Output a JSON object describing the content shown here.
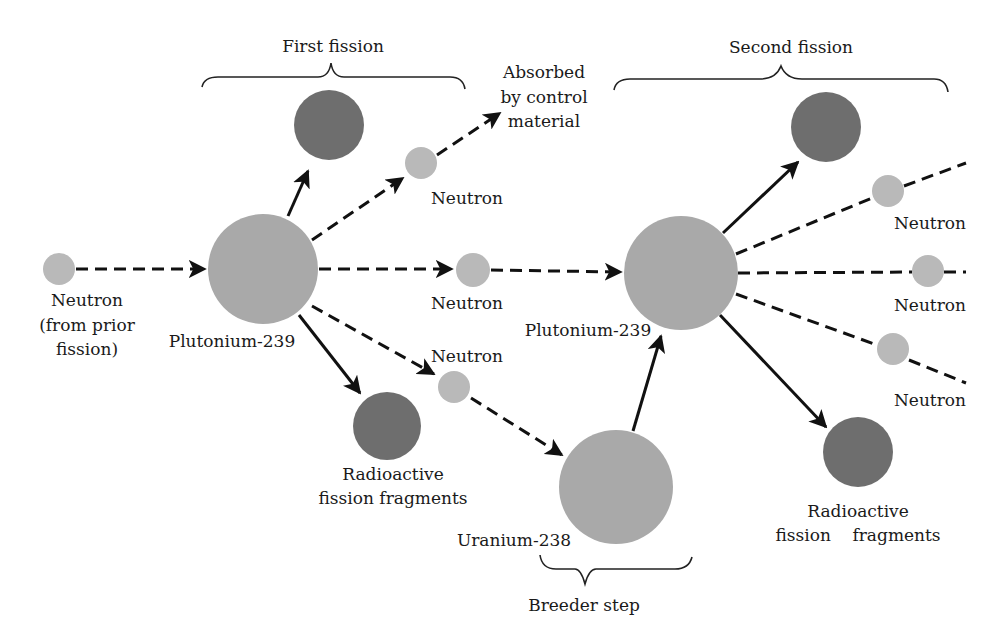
{
  "colors": {
    "neutron": "#b9b9b9",
    "nucleus": "#a9a9a9",
    "fragment": "#6e6e6e",
    "line": "#111111"
  },
  "braces": {
    "first_fission": "First fission",
    "second_fission": "Second fission",
    "breeder_step": "Breeder step"
  },
  "labels": {
    "neutron_prior_1": "Neutron",
    "neutron_prior_2": "(from prior",
    "neutron_prior_3": "fission)",
    "plutonium_1": "Plutonium-239",
    "plutonium_2": "Plutonium-239",
    "uranium": "Uranium-238",
    "absorbed_1": "Absorbed",
    "absorbed_2": "by control",
    "absorbed_3": "material",
    "neutron_absorbed": "Neutron",
    "neutron_mid": "Neutron",
    "neutron_low": "Neutron",
    "frag1_1": "Radioactive",
    "frag1_2": "fission fragments",
    "frag2_1": "Radioactive",
    "frag2_2": "fission    fragments",
    "neutron_r1": "Neutron",
    "neutron_r2": "Neutron",
    "neutron_r3": "Neutron"
  },
  "nodes": [
    {
      "id": "neutron-prior",
      "type": "neutron",
      "cx": 59,
      "cy": 269,
      "r": 16
    },
    {
      "id": "plutonium-239-a",
      "type": "nucleus",
      "cx": 263,
      "cy": 269,
      "r": 55
    },
    {
      "id": "fragment-a-top",
      "type": "fragment",
      "cx": 329,
      "cy": 125,
      "r": 35
    },
    {
      "id": "fragment-a-bottom",
      "type": "fragment",
      "cx": 387,
      "cy": 426,
      "r": 34
    },
    {
      "id": "neutron-absorbed",
      "type": "neutron",
      "cx": 421,
      "cy": 163,
      "r": 16
    },
    {
      "id": "neutron-mid",
      "type": "neutron",
      "cx": 473,
      "cy": 270,
      "r": 17
    },
    {
      "id": "neutron-low",
      "type": "neutron",
      "cx": 454,
      "cy": 387,
      "r": 16
    },
    {
      "id": "plutonium-239-b",
      "type": "nucleus",
      "cx": 681,
      "cy": 273,
      "r": 57
    },
    {
      "id": "uranium-238",
      "type": "nucleus",
      "cx": 616,
      "cy": 487,
      "r": 57
    },
    {
      "id": "fragment-b-top",
      "type": "fragment",
      "cx": 826,
      "cy": 127,
      "r": 35
    },
    {
      "id": "fragment-b-bottom",
      "type": "fragment",
      "cx": 858,
      "cy": 452,
      "r": 35
    },
    {
      "id": "neutron-r1",
      "type": "neutron",
      "cx": 888,
      "cy": 191,
      "r": 16
    },
    {
      "id": "neutron-r2",
      "type": "neutron",
      "cx": 928,
      "cy": 271,
      "r": 16
    },
    {
      "id": "neutron-r3",
      "type": "neutron",
      "cx": 893,
      "cy": 349,
      "r": 16
    }
  ],
  "edges": [
    {
      "id": "prior-to-pu-a",
      "style": "dash",
      "x1": 76,
      "y1": 269,
      "x2": 205,
      "y2": 269,
      "arrow": true
    },
    {
      "id": "pu-a-to-frag-top",
      "style": "solid",
      "x1": 288,
      "y1": 216,
      "x2": 308,
      "y2": 171,
      "arrow": true
    },
    {
      "id": "pu-a-to-neutron-absorbed",
      "style": "dash",
      "x1": 312,
      "y1": 240,
      "x2": 403,
      "y2": 178,
      "arrow": true
    },
    {
      "id": "neutron-absorbed-to-control",
      "style": "dash",
      "x1": 437,
      "y1": 155,
      "x2": 500,
      "y2": 113,
      "arrow": true
    },
    {
      "id": "pu-a-to-neutron-mid",
      "style": "dash",
      "x1": 319,
      "y1": 269,
      "x2": 452,
      "y2": 269,
      "arrow": true
    },
    {
      "id": "neutron-mid-to-pu-b",
      "style": "dash",
      "x1": 491,
      "y1": 270,
      "x2": 621,
      "y2": 272,
      "arrow": true
    },
    {
      "id": "pu-a-to-neutron-low",
      "style": "dash",
      "x1": 312,
      "y1": 306,
      "x2": 434,
      "y2": 374,
      "arrow": true
    },
    {
      "id": "pu-a-to-frag-bottom",
      "style": "solid",
      "x1": 299,
      "y1": 315,
      "x2": 360,
      "y2": 393,
      "arrow": true
    },
    {
      "id": "neutron-low-to-u238",
      "style": "dash",
      "x1": 471,
      "y1": 398,
      "x2": 562,
      "y2": 455,
      "arrow": true
    },
    {
      "id": "u238-to-pu-b",
      "style": "solid",
      "x1": 633,
      "y1": 431,
      "x2": 661,
      "y2": 336,
      "arrow": true
    },
    {
      "id": "pu-b-to-frag-top",
      "style": "solid",
      "x1": 723,
      "y1": 233,
      "x2": 798,
      "y2": 162,
      "arrow": true
    },
    {
      "id": "pu-b-to-neutron-r1",
      "style": "dash",
      "x1": 736,
      "y1": 254,
      "x2": 872,
      "y2": 198,
      "arrow": false
    },
    {
      "id": "neutron-r1-out",
      "style": "dash",
      "x1": 904,
      "y1": 186,
      "x2": 966,
      "y2": 163,
      "arrow": false
    },
    {
      "id": "pu-b-to-neutron-r2",
      "style": "dash",
      "x1": 738,
      "y1": 273,
      "x2": 912,
      "y2": 272,
      "arrow": false
    },
    {
      "id": "neutron-r2-out",
      "style": "dash",
      "x1": 944,
      "y1": 272,
      "x2": 966,
      "y2": 272,
      "arrow": false
    },
    {
      "id": "pu-b-to-neutron-r3",
      "style": "dash",
      "x1": 736,
      "y1": 294,
      "x2": 877,
      "y2": 345,
      "arrow": false
    },
    {
      "id": "neutron-r3-out",
      "style": "dash",
      "x1": 909,
      "y1": 360,
      "x2": 966,
      "y2": 383,
      "arrow": false
    },
    {
      "id": "pu-b-to-frag-bottom",
      "style": "solid",
      "x1": 720,
      "y1": 315,
      "x2": 826,
      "y2": 427,
      "arrow": true
    }
  ]
}
